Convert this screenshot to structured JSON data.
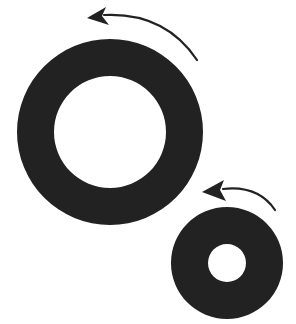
{
  "diagram": {
    "colors": {
      "background": "#ffffff",
      "ring": "#222222",
      "arrow": "#222222"
    },
    "elements": [
      {
        "name": "large-ring",
        "cx": 110,
        "cy": 132,
        "outer_r": 93,
        "inner_r": 56,
        "arrow": {
          "direction": "counter-clockwise",
          "tip": [
            87,
            18
          ],
          "path": "M 197 60 Q 165 12 104 15"
        }
      },
      {
        "name": "small-ring",
        "cx": 227,
        "cy": 263,
        "outer_r": 56,
        "inner_r": 19,
        "arrow": {
          "direction": "counter-clockwise",
          "tip": [
            202,
            192
          ],
          "path": "M 275 210 Q 258 185 223 189"
        }
      }
    ]
  }
}
